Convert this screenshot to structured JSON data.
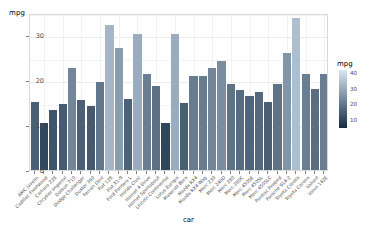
{
  "chart_data": {
    "type": "bar",
    "title": "",
    "subtitle": "",
    "xlabel": "car",
    "ylabel": "mpg",
    "ylim": [
      0,
      35
    ],
    "yticks": [
      0,
      10,
      20,
      30
    ],
    "ytick_labels": [
      "0",
      "10",
      "20",
      "30"
    ],
    "grid": true,
    "grid_major_color": "#ebebeb",
    "grid_minor_color": "#f4f4f4",
    "panel_background": "#ffffff",
    "panel_border_color": "#d9d9d9",
    "legend": {
      "title": "mpg",
      "position": "right",
      "type": "continuous-colorbar",
      "ticks": [
        10,
        20,
        30,
        40
      ],
      "tick_labels": [
        "10",
        "20",
        "30",
        "40"
      ],
      "range": [
        5,
        42
      ],
      "low_color": "#132b43",
      "high_color": "#d8e7f5"
    },
    "categories": [
      "AMC Javelin",
      "Cadillac Fleetwood",
      "Camaro Z28",
      "Chrysler Imperial",
      "Datsun 710",
      "Dodge Challenger",
      "Duster 360",
      "Ferrari Dino",
      "Fiat 128",
      "Fiat X1-9",
      "Ford Pantera L",
      "Honda Civic",
      "Hornet 4 Drive",
      "Hornet Sportabout",
      "Lincoln Continental",
      "Lotus Europa",
      "Maserati Bora",
      "Mazda RX4",
      "Mazda RX4 Wag",
      "Merc 230",
      "Merc 240D",
      "Merc 280",
      "Merc 280C",
      "Merc 450SE",
      "Merc 450SL",
      "Merc 450SLC",
      "Pontiac Firebird",
      "Porsche 914-2",
      "Toyota Corolla",
      "Toyota Corona",
      "Valiant",
      "Volvo 142E"
    ],
    "values": [
      15.2,
      10.4,
      13.3,
      14.7,
      22.8,
      15.5,
      14.3,
      19.7,
      32.4,
      27.3,
      15.8,
      30.4,
      21.4,
      18.7,
      10.4,
      30.4,
      15.0,
      21.0,
      21.0,
      22.8,
      24.4,
      19.2,
      17.8,
      16.4,
      17.3,
      15.2,
      19.2,
      26.0,
      33.9,
      21.5,
      18.1,
      21.4
    ]
  }
}
